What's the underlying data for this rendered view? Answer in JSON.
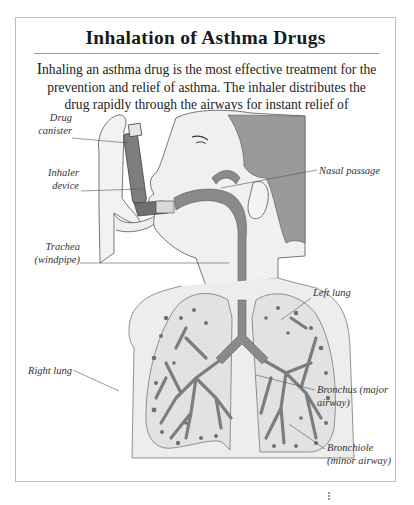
{
  "figure": {
    "title": "Inhalation of Asthma Drugs",
    "intro_cap": "I",
    "intro_text": "nhaling an asthma drug is the most effective treatment for the prevention and relief of asthma. The inhaler distributes the drug rapidly through the airways for instant relief of symptoms."
  },
  "labels": {
    "drug_canister_1": "Drug",
    "drug_canister_2": "canister",
    "inhaler_device_1": "Inhaler",
    "inhaler_device_2": "device",
    "trachea_1": "Trachea",
    "trachea_2": "(windpipe)",
    "nasal_passage": "Nasal passage",
    "left_lung": "Left lung",
    "right_lung": "Right lung",
    "bronchus_1": "Bronchus (major",
    "bronchus_2": "airway)",
    "bronchiole_1": "Bronchiole",
    "bronchiole_2": "(minor airway)"
  },
  "colors": {
    "airway": "#8a8a8a",
    "skin": "#efefef",
    "hair": "#8f8f8f",
    "outline": "#555555",
    "border": "#bdbdbd"
  }
}
